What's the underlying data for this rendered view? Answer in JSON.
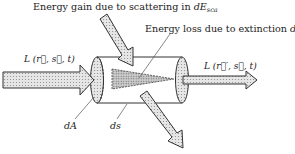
{
  "labels": {
    "scattering_gain": {
      "prefix": "Energy gain due to scattering in ",
      "symbol": "dE",
      "subscript": "sca"
    },
    "extinction_loss": {
      "prefix": "Energy loss due to extinction ",
      "symbol": "dE",
      "subscript": "ext"
    },
    "incoming_radiance": "L (r⃗, s⃗, t)",
    "outgoing_radiance": "L (r⃗′, s⃗, t)",
    "area_element": "dA",
    "path_element": "ds"
  },
  "colors": {
    "stroke": "#333333",
    "arrow_fill": "#d9d9d9",
    "cone_fill": "#bdbdbd",
    "background": "#ffffff"
  }
}
